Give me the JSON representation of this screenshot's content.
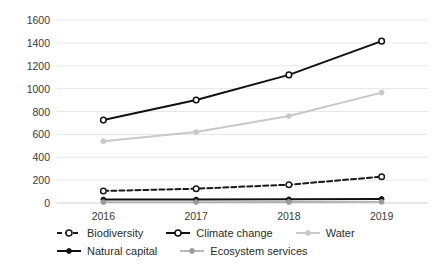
{
  "chart_data": {
    "type": "line",
    "title": "",
    "xlabel": "",
    "ylabel": "",
    "categories": [
      "2016",
      "2017",
      "2018",
      "2019"
    ],
    "ylim": [
      0,
      1600
    ],
    "ytick_labels": [
      "0",
      "200",
      "400",
      "600",
      "800",
      "1000",
      "1200",
      "1400",
      "1600"
    ],
    "yticks": [
      0,
      200,
      400,
      600,
      800,
      1000,
      1200,
      1400,
      1600
    ],
    "grid": true,
    "legend_position": "bottom",
    "series": [
      {
        "name": "Biodiversity",
        "values": [
          105,
          125,
          160,
          230
        ],
        "color": "#1a1a1a",
        "line_style": "dashed",
        "marker": "open-circle"
      },
      {
        "name": "Climate change",
        "values": [
          725,
          900,
          1120,
          1415
        ],
        "color": "#111111",
        "line_style": "solid",
        "marker": "open-circle"
      },
      {
        "name": "Water",
        "values": [
          540,
          620,
          760,
          965
        ],
        "color": "#c8c8c8",
        "line_style": "solid",
        "marker": "filled-circle"
      },
      {
        "name": "Natural capital",
        "values": [
          30,
          30,
          32,
          35
        ],
        "color": "#111111",
        "line_style": "solid",
        "marker": "filled-circle"
      },
      {
        "name": "Ecosystem services",
        "values": [
          8,
          8,
          9,
          10
        ],
        "color": "#9a9a9a",
        "line_style": "solid",
        "marker": "filled-circle"
      }
    ]
  },
  "legend": {
    "rows": [
      [
        {
          "label": "Biodiversity",
          "key": "dashed-open-circle-key"
        },
        {
          "label": "Climate change",
          "key": "solid-open-circle-key"
        },
        {
          "label": "Water",
          "key": "solid-light-filled-circle-key"
        }
      ],
      [
        {
          "label": "Natural capital",
          "key": "solid-filled-circle-key"
        },
        {
          "label": "Ecosystem services",
          "key": "solid-gray-filled-circle-key"
        }
      ]
    ]
  }
}
